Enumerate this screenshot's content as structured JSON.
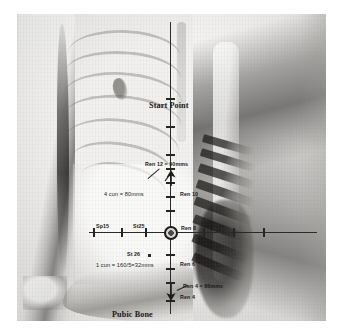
{
  "figure": {
    "type": "anatomical-measurement-diagram",
    "background_color": "#f2f1ef",
    "ink_color": "#1a1a18"
  },
  "labels": {
    "start_point": "Start Point",
    "pubic_bone": "Pubic Bone",
    "ren12": "Ren 12 = 90mms",
    "ren10": "Ren 10",
    "ren8": "Ren 8",
    "ren6": "Ren 6",
    "ren4_measure": "Ren 4 = 86mms",
    "ren4": "Ren 4",
    "sp15": "Sp15",
    "st25": "St25",
    "st26": "St 26",
    "cun4": "4 cun = 80mms",
    "cun1": "1 cun = 160/5=32mms"
  },
  "measurements": {
    "ren12_mm": 90,
    "ren4_mm": 86,
    "four_cun_mm": 80,
    "one_cun_mm": 32,
    "one_cun_formula": "160/5",
    "unit": "mms"
  },
  "points": [
    {
      "name": "Start Point",
      "kind": "landmark"
    },
    {
      "name": "Ren 12",
      "kind": "ren-point",
      "value": "90mms"
    },
    {
      "name": "Ren 10",
      "kind": "ren-point"
    },
    {
      "name": "Ren 8",
      "kind": "ren-point"
    },
    {
      "name": "Ren 6",
      "kind": "ren-point"
    },
    {
      "name": "Ren 4",
      "kind": "ren-point",
      "value": "86mms"
    },
    {
      "name": "Sp15",
      "kind": "lateral-point"
    },
    {
      "name": "St25",
      "kind": "lateral-point"
    },
    {
      "name": "St 26",
      "kind": "lateral-point"
    },
    {
      "name": "Pubic Bone",
      "kind": "landmark"
    }
  ]
}
